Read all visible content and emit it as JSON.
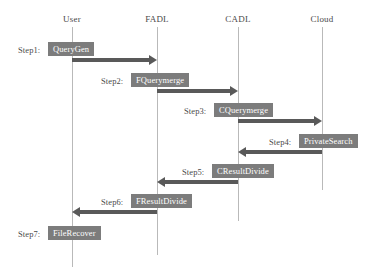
{
  "diagram": {
    "type": "sequence-diagram",
    "colors": {
      "box_fill": "#7c7c7c",
      "box_text": "#ffffff",
      "arrow": "#595959",
      "lifeline": "#b9b9b9",
      "label_text": "#4a4a4a",
      "background": "#ffffff"
    },
    "lifelines": [
      {
        "id": "user",
        "label": "User",
        "x": 72
      },
      {
        "id": "fadl",
        "label": "FADL",
        "x": 157
      },
      {
        "id": "cadl",
        "label": "CADL",
        "x": 238
      },
      {
        "id": "cloud",
        "label": "Cloud",
        "x": 322
      }
    ],
    "steps": [
      {
        "id": "step1",
        "label": "Step1:",
        "operation": "QueryGen",
        "from": "user",
        "to": "fadl",
        "direction": "right"
      },
      {
        "id": "step2",
        "label": "Step2:",
        "operation": "FQuerymerge",
        "from": "fadl",
        "to": "cadl",
        "direction": "right"
      },
      {
        "id": "step3",
        "label": "Step3:",
        "operation": "CQuerymerge",
        "from": "cadl",
        "to": "cloud",
        "direction": "right"
      },
      {
        "id": "step4",
        "label": "Step4:",
        "operation": "PrivateSearch",
        "from": "cloud",
        "to": "cadl",
        "direction": "left"
      },
      {
        "id": "step5",
        "label": "Step5:",
        "operation": "CResultDivide",
        "from": "cadl",
        "to": "fadl",
        "direction": "left"
      },
      {
        "id": "step6",
        "label": "Step6:",
        "operation": "FResultDivide",
        "from": "fadl",
        "to": "user",
        "direction": "left"
      },
      {
        "id": "step7",
        "label": "Step7:",
        "operation": "FileRecover",
        "from": "user",
        "to": "user",
        "direction": "none"
      }
    ]
  }
}
